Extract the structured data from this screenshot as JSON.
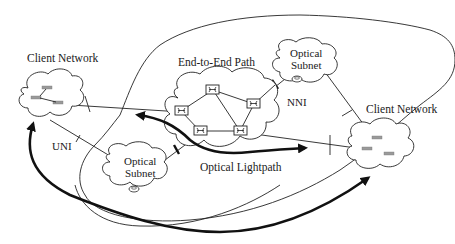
{
  "diagram": {
    "labels": {
      "client_network_left": "Client Network",
      "client_network_right": "Client Network",
      "end_to_end_path": "End-to-End Path",
      "optical_subnet_top_line1": "Optical",
      "optical_subnet_top_line2": "Subnet",
      "optical_subnet_bottom_line1": "Optical",
      "optical_subnet_bottom_line2": "Subnet",
      "nni": "NNI",
      "uni": "UNI",
      "optical_lightpath": "Optical Lightpath"
    },
    "nodes": [
      {
        "id": "client-left",
        "type": "cloud",
        "label": "Client Network"
      },
      {
        "id": "client-right",
        "type": "cloud",
        "label": "Client Network"
      },
      {
        "id": "core-network",
        "type": "cloud",
        "switches": 5
      },
      {
        "id": "optical-subnet-top",
        "type": "cloud",
        "label": "Optical Subnet"
      },
      {
        "id": "optical-subnet-bottom",
        "type": "cloud",
        "label": "Optical Subnet"
      }
    ],
    "edges": [
      {
        "from": "client-left",
        "to": "core-network",
        "interface": "UNI"
      },
      {
        "from": "client-left",
        "to": "optical-subnet-bottom",
        "interface": "UNI"
      },
      {
        "from": "optical-subnet-top",
        "to": "core-network",
        "interface": "NNI"
      },
      {
        "from": "optical-subnet-bottom",
        "to": "core-network",
        "interface": "NNI"
      },
      {
        "from": "core-network",
        "to": "client-right",
        "interface": "UNI"
      },
      {
        "from": "optical-subnet-top",
        "to": "client-right",
        "interface": "UNI"
      }
    ],
    "arrows": [
      {
        "name": "optical-lightpath",
        "style": "thick bidirectional",
        "across": "core-network"
      },
      {
        "name": "end-to-end-path",
        "style": "thick bidirectional",
        "from": "client-left",
        "to": "client-right"
      }
    ],
    "colors": {
      "stroke": "#222222",
      "background": "#ffffff",
      "device": "#9a9a9a"
    }
  }
}
